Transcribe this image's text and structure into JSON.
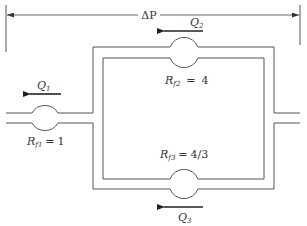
{
  "diagram": {
    "type": "parallel-pipe-network",
    "pressure_drop": {
      "label": "ΔP"
    },
    "flows": [
      {
        "id": "Q1",
        "label": "Q",
        "subscript": "1",
        "direction": "left"
      },
      {
        "id": "Q2",
        "label": "Q",
        "subscript": "2",
        "direction": "left"
      },
      {
        "id": "Q3",
        "label": "Q",
        "subscript": "3",
        "direction": "left"
      }
    ],
    "resistances": [
      {
        "id": "Rf1",
        "symbol": "R",
        "subscript": "f1",
        "value": "1"
      },
      {
        "id": "Rf2",
        "symbol": "R",
        "subscript": "f2",
        "value": "4"
      },
      {
        "id": "Rf3",
        "symbol": "R",
        "subscript": "f3",
        "value": "4/3"
      }
    ],
    "equals": "="
  },
  "colors": {
    "pipe": "#555555",
    "arrow": "#222222",
    "text": "#333333",
    "background": "#ffffff"
  }
}
